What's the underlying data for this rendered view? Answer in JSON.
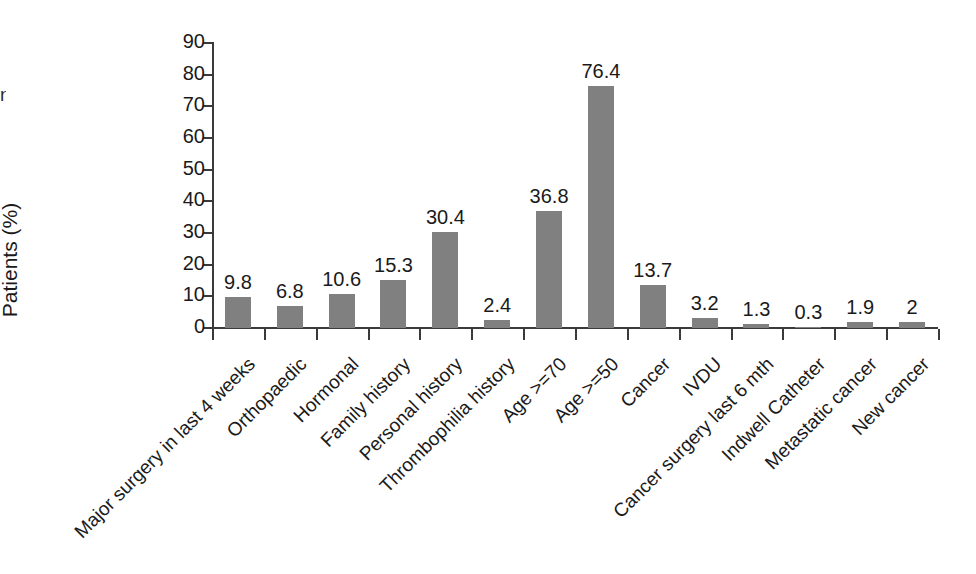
{
  "edge_fragment": "n",
  "chart_data": {
    "type": "bar",
    "title": "",
    "xlabel": "",
    "ylabel": "Patients (%)",
    "ylim": [
      0,
      90
    ],
    "yticks": [
      0,
      10,
      20,
      30,
      40,
      50,
      60,
      70,
      80,
      90
    ],
    "ytick_labels": [
      "0",
      "10",
      "20",
      "30",
      "40",
      "50",
      "60",
      "70",
      "80",
      "90"
    ],
    "grid": false,
    "legend": false,
    "bar_color": "#808080",
    "axis_color": "#3a3a3a",
    "text_color": "#1a1a1a",
    "categories": [
      "Major surgery in last 4 weeks",
      "Orthopaedic",
      "Hormonal",
      "Family history",
      "Personal history",
      "Thrombophilia history",
      "Age >=70",
      "Age >=50",
      "Cancer",
      "IVDU",
      "Cancer surgery last 6 mth",
      "Indwell Catheter",
      "Metastatic cancer",
      "New cancer"
    ],
    "values": [
      9.8,
      6.8,
      10.6,
      15.3,
      30.4,
      2.4,
      36.8,
      76.4,
      13.7,
      3.2,
      1.3,
      0.3,
      1.9,
      2
    ],
    "value_labels": [
      "9.8",
      "6.8",
      "10.6",
      "15.3",
      "30.4",
      "2.4",
      "36.8",
      "76.4",
      "13.7",
      "3.2",
      "1.3",
      "0.3",
      "1.9",
      "2"
    ]
  }
}
